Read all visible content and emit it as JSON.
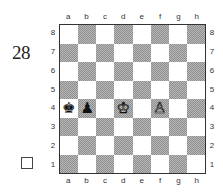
{
  "diagram": {
    "number": "28",
    "to_move_indicator": "empty-square-box",
    "files": [
      "a",
      "b",
      "c",
      "d",
      "e",
      "f",
      "g",
      "h"
    ],
    "ranks": [
      "8",
      "7",
      "6",
      "5",
      "4",
      "3",
      "2",
      "1"
    ],
    "colors": {
      "light_square": "#ffffff",
      "dark_square": "#a8a8a8",
      "border": "#333333"
    },
    "pieces": [
      {
        "square": "a4",
        "color": "black",
        "type": "king",
        "glyph": "♚"
      },
      {
        "square": "b4",
        "color": "black",
        "type": "pawn",
        "glyph": "♟"
      },
      {
        "square": "d4",
        "color": "white",
        "type": "king",
        "glyph": "♔"
      },
      {
        "square": "f4",
        "color": "white",
        "type": "pawn",
        "glyph": "♙"
      }
    ]
  }
}
